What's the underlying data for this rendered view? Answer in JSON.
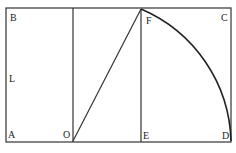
{
  "diagram": {
    "labels": {
      "A": "A",
      "B": "B",
      "C": "C",
      "D": "D",
      "E": "E",
      "F": "F",
      "L": "L",
      "O": "O"
    },
    "colors": {
      "stroke": "#333333",
      "text": "#222222",
      "background": "#ffffff"
    }
  }
}
